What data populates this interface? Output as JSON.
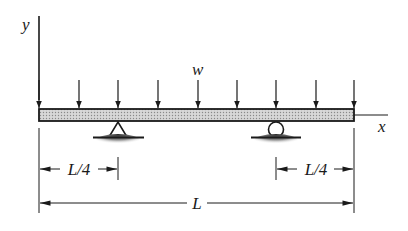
{
  "figure": {
    "type": "beam-diagram"
  },
  "labels": {
    "y_axis": "y",
    "x_axis": "x",
    "load": "w",
    "left_overhang": "L/4",
    "right_overhang": "L/4",
    "total_length": "L"
  },
  "beam": {
    "x_start": 39,
    "x_end": 354,
    "top": 109,
    "bottom": 121,
    "fill": "#c8c8c8"
  },
  "load_arrows_x": [
    39,
    79,
    118,
    158,
    198,
    237,
    276,
    316,
    354
  ],
  "supports": [
    {
      "type": "pin",
      "x": 118
    },
    {
      "type": "roller",
      "x": 276
    }
  ],
  "colors": {
    "line": "#1a1a1a",
    "beam_fill": "#c8c8c8",
    "ground_shadow": "#555555"
  }
}
